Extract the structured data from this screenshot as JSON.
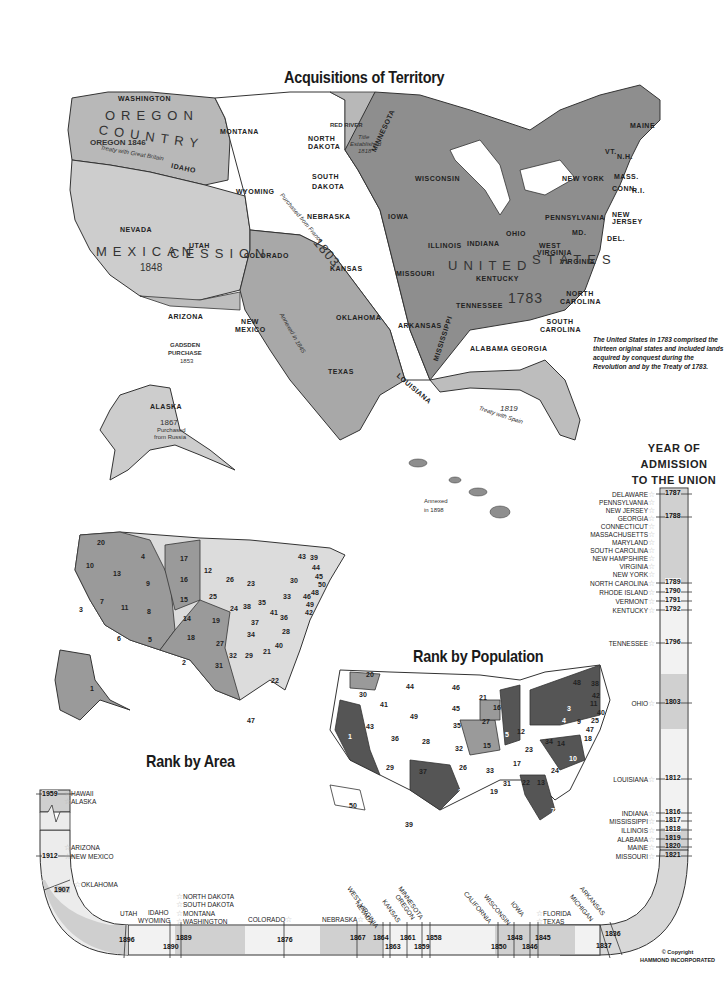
{
  "acquisitions_map": {
    "title": "Acquisitions of Territory",
    "caption": "The United States in 1783 comprised the thirteen original states and included lands acquired by conquest during the Revolution and by the Treaty of 1783.",
    "regions": [
      {
        "name": "OREGON COUNTRY",
        "year": "1846",
        "note": "Treaty with Great Britain",
        "shade": "#bdbdbd"
      },
      {
        "name": "MEXICAN CESSION",
        "year": "1848",
        "shade": "#cfcfcf"
      },
      {
        "name": "LOUISIANA",
        "year": "1803",
        "note": "Purchased from France",
        "shade": "#ffffff"
      },
      {
        "name": "TEXAS",
        "year": "1845",
        "note": "Annexed in 1845",
        "shade": "#a8a8a8"
      },
      {
        "name": "GADSDEN PURCHASE",
        "year": "1853",
        "shade": "#bdbdbd"
      },
      {
        "name": "RED RIVER",
        "year": "1818",
        "note": "Title Established 1818",
        "shade": "#bdbdbd"
      },
      {
        "name": "UNITED STATES",
        "year": "1783",
        "shade": "#8c8c8c"
      },
      {
        "name": "FLORIDA",
        "year": "1819",
        "note": "Treaty with Spain",
        "shade": "#bdbdbd"
      },
      {
        "name": "ALASKA",
        "year": "1867",
        "note": "Purchased from Russia",
        "shade": "#cfcfcf"
      },
      {
        "name": "HAWAII",
        "note": "Annexed in 1898",
        "shade": "#8c8c8c"
      }
    ],
    "state_labels": {
      "washington": "WASHINGTON",
      "oregon": "OREGON",
      "idaho": "IDAHO",
      "montana": "MONTANA",
      "wyoming": "WYOMING",
      "nevada": "NEVADA",
      "utah": "UTAH",
      "colorado": "COLORADO",
      "arizona": "ARIZONA",
      "new_mexico": "NEW MEXICO",
      "texas": "TEXAS",
      "north_dakota": "NORTH DAKOTA",
      "south_dakota": "SOUTH DAKOTA",
      "nebraska": "NEBRASKA",
      "kansas": "KANSAS",
      "oklahoma": "OKLAHOMA",
      "minnesota": "MINNESOTA",
      "iowa": "IOWA",
      "missouri": "MISSOURI",
      "arkansas": "ARKANSAS",
      "louisiana": "LOUISIANA",
      "wisconsin": "WISCONSIN",
      "michigan": "MICHIGAN",
      "illinois": "ILLINOIS",
      "indiana": "INDIANA",
      "ohio": "OHIO",
      "kentucky": "KENTUCKY",
      "tennessee": "TENNESSEE",
      "mississippi": "MISSISSIPPI",
      "alabama": "ALABAMA",
      "georgia": "GEORGIA",
      "florida": "FLORIDA",
      "south_carolina": "SOUTH CAROLINA",
      "north_carolina": "NORTH CAROLINA",
      "virginia": "VIRGINIA",
      "west_virginia": "WEST VIRGINIA",
      "pennsylvania": "PENNSYLVANIA",
      "new_york": "NEW YORK",
      "new_jersey": "NEW JERSEY",
      "delaware": "DEL.",
      "maryland": "MD.",
      "vermont": "VT.",
      "new_hampshire": "N.H.",
      "massachusetts": "MASS.",
      "connecticut": "CONN.",
      "rhode_island": "R.I.",
      "maine": "MAINE",
      "california": "CALIFORNIA",
      "alaska": "ALASKA"
    },
    "notes": {
      "oregon_year": "OREGON 1846",
      "oregon_treaty": "Treaty with Great Britain",
      "red_river": "RED RIVER",
      "red_river_title": "Title",
      "red_river_est": "Established",
      "red_river_year": "1818",
      "mexican_year": "1848",
      "gadsden": "GADSDEN",
      "gadsden2": "PURCHASE",
      "gadsden_year": "1853",
      "louisiana_year": "1803",
      "purchased_france": "Purchased from France",
      "texas_annexed": "Annexed in 1845",
      "us_year": "1783",
      "florida_year": "1819",
      "florida_treaty": "Treaty with Spain",
      "alaska_year": "1867",
      "alaska_purchased": "Purchased",
      "alaska_russia": "from Russia",
      "hawaii_annexed": "Annexed",
      "hawaii_year": "in 1898",
      "oregon_big1": "OREGON",
      "oregon_big2": "COUNTRY",
      "mexican_big1": "MEXICAN",
      "mexican_big2": "CESSION",
      "louisiana_big": "LOUISIANA",
      "texas_big": "TEXAS",
      "united_big": "UNITED",
      "states_big": "STATES",
      "florida_big": "FLORIDA",
      "hawaii_big": "HAWAII"
    }
  },
  "rank_by_area": {
    "title": "Rank by Area",
    "ranks": {
      "AK": 1,
      "TX": 2,
      "CA": 3,
      "MT": 4,
      "NM": 5,
      "AZ": 6,
      "NV": 7,
      "CO": 8,
      "WY": 9,
      "OR": 10,
      "UT": 11,
      "MN": 12,
      "ID": 13,
      "KS": 14,
      "NE": 15,
      "SD": 16,
      "ND": 17,
      "OK": 18,
      "MO": 19,
      "WA": 20,
      "GA": 21,
      "FL": 22,
      "MI": 23,
      "IL": 24,
      "IA": 25,
      "WI": 26,
      "AR": 27,
      "NC": 28,
      "AL": 29,
      "NY": 30,
      "LA": 31,
      "MS": 32,
      "PA": 33,
      "TN": 34,
      "OH": 35,
      "VA": 36,
      "KY": 37,
      "IN": 38,
      "ME": 39,
      "SC": 40,
      "WV": 41,
      "MD": 42,
      "VT": 43,
      "NH": 44,
      "MA": 45,
      "NJ": 46,
      "HI": 47,
      "CT": 48,
      "DE": 49,
      "RI": 50
    }
  },
  "rank_by_population": {
    "title": "Rank by Population",
    "ranks": {
      "CA": 1,
      "TX": 2,
      "NY": 3,
      "PA": 4,
      "IL": 5,
      "OH": 6,
      "FL": 7,
      "MI": 8,
      "NJ": 9,
      "NC": 10,
      "MA": 11,
      "IN": 12,
      "GA": 13,
      "VA": 14,
      "MO": 15,
      "WI": 16,
      "TN": 17,
      "MD": 18,
      "LA": 19,
      "WA": 20,
      "MN": 21,
      "AL": 22,
      "KY": 23,
      "SC": 24,
      "CT": 25,
      "OK": 26,
      "IA": 27,
      "CO": 28,
      "AZ": 29,
      "OR": 30,
      "MS": 31,
      "KS": 32,
      "AR": 33,
      "WV": 34,
      "NE": 35,
      "UT": 36,
      "NM": 37,
      "ME": 38,
      "HI": 39,
      "RI": 40,
      "ID": 41,
      "NH": 42,
      "NV": 43,
      "MT": 44,
      "SD": 45,
      "ND": 46,
      "DE": 47,
      "VT": 48,
      "WY": 49,
      "AK": 50
    }
  },
  "admission_timeline": {
    "title_line1": "YEAR OF",
    "title_line2": "ADMISSION",
    "title_line3": "TO THE UNION",
    "vertical": [
      {
        "state": "DELAWARE",
        "year": "1787"
      },
      {
        "state": "PENNSYLVANIA",
        "year": ""
      },
      {
        "state": "NEW JERSEY",
        "year": ""
      },
      {
        "state": "GEORGIA",
        "year": "1788"
      },
      {
        "state": "CONNECTICUT",
        "year": ""
      },
      {
        "state": "MASSACHUSETTS",
        "year": ""
      },
      {
        "state": "MARYLAND",
        "year": ""
      },
      {
        "state": "SOUTH CAROLINA",
        "year": ""
      },
      {
        "state": "NEW HAMPSHIRE",
        "year": ""
      },
      {
        "state": "VIRGINIA",
        "year": ""
      },
      {
        "state": "NEW YORK",
        "year": ""
      },
      {
        "state": "NORTH CAROLINA",
        "year": "1789"
      },
      {
        "state": "RHODE ISLAND",
        "year": "1790"
      },
      {
        "state": "VERMONT",
        "year": "1791"
      },
      {
        "state": "KENTUCKY",
        "year": "1792"
      },
      {
        "state": "TENNESSEE",
        "year": "1796"
      },
      {
        "state": "OHIO",
        "year": "1803"
      },
      {
        "state": "LOUISIANA",
        "year": "1812"
      },
      {
        "state": "INDIANA",
        "year": "1816"
      },
      {
        "state": "MISSISSIPPI",
        "year": "1817"
      },
      {
        "state": "ILLINOIS",
        "year": "1818"
      },
      {
        "state": "ALABAMA",
        "year": "1819"
      },
      {
        "state": "MAINE",
        "year": "1820"
      },
      {
        "state": "MISSOURI",
        "year": "1821"
      }
    ],
    "bottom_years": [
      "1896",
      "1890",
      "1889",
      "1876",
      "1867",
      "1864",
      "1863",
      "1861",
      "1859",
      "1858",
      "1850",
      "1848",
      "1846",
      "1845",
      "1837",
      "1836"
    ],
    "bottom_states": {
      "utah": "UTAH",
      "idaho": "IDAHO",
      "wyoming": "WYOMING",
      "north_dakota": "NORTH DAKOTA",
      "south_dakota": "SOUTH DAKOTA",
      "montana": "MONTANA",
      "washington": "WASHINGTON",
      "colorado": "COLORADO",
      "nebraska": "NEBRASKA",
      "west_virginia": "WEST VIRGINIA",
      "nevada": "NEVADA",
      "kansas": "KANSAS",
      "oregon": "OREGON",
      "minnesota": "MINNESOTA",
      "california": "CALIFORNIA",
      "wisconsin": "WISCONSIN",
      "iowa": "IOWA",
      "florida": "FLORIDA",
      "texas": "TEXAS",
      "michigan": "MICHIGAN",
      "arkansas": "ARKANSAS"
    },
    "left_top": [
      {
        "state": "HAWAII",
        "year": "1959"
      },
      {
        "state": "ALASKA",
        "year": ""
      },
      {
        "state": "ARIZONA",
        "year": "1912"
      },
      {
        "state": "NEW MEXICO",
        "year": ""
      },
      {
        "state": "OKLAHOMA",
        "year": "1907"
      }
    ]
  },
  "copyright": {
    "line1": "© Copyright",
    "line2": "HAMMOND INCORPORATED"
  }
}
